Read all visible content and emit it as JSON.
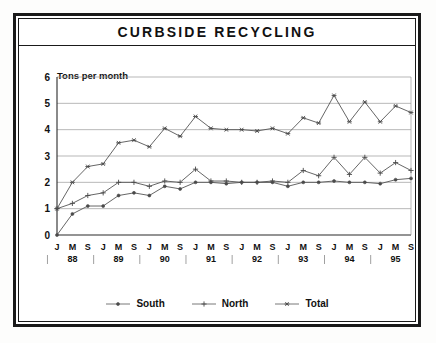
{
  "chart_title": "CURBSIDE RECYCLING",
  "chart_data": {
    "type": "line",
    "title": "CURBSIDE RECYCLING",
    "xlabel": "",
    "ylabel": "Tons per month",
    "ylim": [
      0,
      6
    ],
    "yticks": [
      0,
      1,
      2,
      3,
      4,
      5,
      6
    ],
    "ytick_labels": [
      "0",
      "1",
      "2",
      "3",
      "4",
      "5",
      "6"
    ],
    "grid": true,
    "legend_position": "bottom",
    "categories": [
      "J 88",
      "M 88",
      "S 88",
      "J 89",
      "M 89",
      "S 89",
      "J 90",
      "M 90",
      "S 90",
      "J 91",
      "M 91",
      "S 91",
      "J 92",
      "M 92",
      "S 92",
      "J 93",
      "M 93",
      "S 93",
      "J 94",
      "M 94",
      "S 94",
      "J 95",
      "M 95",
      "S 95"
    ],
    "month_tick_labels": [
      "J",
      "M",
      "S",
      "J",
      "M",
      "S",
      "J",
      "M",
      "S",
      "J",
      "M",
      "S",
      "J",
      "M",
      "S",
      "J",
      "M",
      "S",
      "J",
      "M",
      "S",
      "J",
      "M",
      "S"
    ],
    "year_labels": [
      "88",
      "89",
      "90",
      "91",
      "92",
      "93",
      "94",
      "95"
    ],
    "series": [
      {
        "name": "South",
        "marker": "dot",
        "values": [
          0.0,
          0.8,
          1.1,
          1.1,
          1.5,
          1.6,
          1.5,
          1.85,
          1.75,
          2.0,
          2.0,
          1.95,
          2.0,
          2.0,
          2.0,
          1.85,
          2.0,
          2.0,
          2.05,
          2.0,
          2.0,
          1.95,
          2.1,
          2.15
        ]
      },
      {
        "name": "North",
        "marker": "plus",
        "values": [
          1.0,
          1.2,
          1.5,
          1.6,
          2.0,
          2.0,
          1.85,
          2.05,
          2.0,
          2.5,
          2.05,
          2.05,
          2.0,
          2.0,
          2.05,
          2.0,
          2.45,
          2.25,
          2.95,
          2.3,
          2.95,
          2.35,
          2.75,
          2.45
        ]
      },
      {
        "name": "Total",
        "marker": "asterisk",
        "values": [
          1.0,
          2.0,
          2.6,
          2.7,
          3.5,
          3.6,
          3.35,
          4.05,
          3.75,
          4.5,
          4.05,
          4.0,
          4.0,
          3.95,
          4.05,
          3.85,
          4.45,
          4.25,
          5.3,
          4.3,
          5.05,
          4.3,
          4.9,
          4.65
        ]
      }
    ]
  },
  "legend": [
    {
      "label": "South",
      "marker": "dot"
    },
    {
      "label": "North",
      "marker": "plus"
    },
    {
      "label": "Total",
      "marker": "asterisk"
    }
  ]
}
